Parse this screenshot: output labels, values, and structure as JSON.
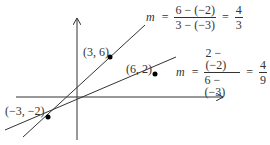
{
  "diagram": {
    "points": [
      {
        "label": "(3, 6)",
        "x": 3,
        "y": 6
      },
      {
        "label": "(6, 2)",
        "x": 6,
        "y": 2
      },
      {
        "label": "(−3, −2)",
        "x": -3,
        "y": -2
      }
    ],
    "slope1": {
      "var": "m",
      "eq": "=",
      "num": "6 − (−2)",
      "den": "3 − (−3)",
      "eq2": "=",
      "result_num": "4",
      "result_den": "3"
    },
    "slope2": {
      "var": "m",
      "eq": "=",
      "num": "2 − (−2)",
      "den": "6 − (−3)",
      "eq2": "=",
      "result_num": "4",
      "result_den": "9"
    },
    "colors": {
      "line": "#333333",
      "point": "#000000"
    }
  }
}
